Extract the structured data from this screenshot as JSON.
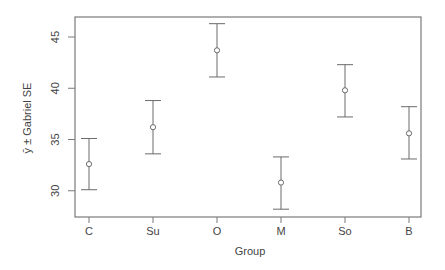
{
  "chart_data": {
    "type": "errorbar",
    "title": "",
    "xlabel": "Group",
    "ylabel": "ȳ ± Gabriel SE",
    "categories": [
      "C",
      "Su",
      "O",
      "M",
      "So",
      "B"
    ],
    "series": [
      {
        "name": "mean",
        "values": [
          32.6,
          36.2,
          43.7,
          30.8,
          39.8,
          35.6
        ]
      },
      {
        "name": "upper",
        "values": [
          35.1,
          38.8,
          46.3,
          33.3,
          42.3,
          38.2
        ]
      },
      {
        "name": "lower",
        "values": [
          30.1,
          33.6,
          41.1,
          28.2,
          37.2,
          33.1
        ]
      }
    ],
    "yticks": [
      30,
      35,
      40,
      45
    ],
    "ylim": [
      27.4,
      46.9
    ],
    "grid": false,
    "legend": null
  },
  "colors": {
    "frame": "#7a7a7a",
    "errorbar": "#6a6a6a",
    "text": "#444444"
  }
}
